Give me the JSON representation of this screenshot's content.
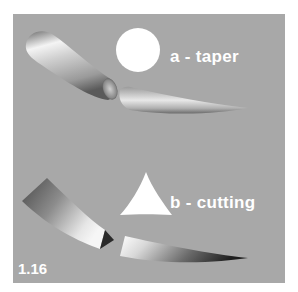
{
  "figure": {
    "number": "1.16",
    "panels": [
      {
        "id": "a",
        "label": "a - taper",
        "cross_section_shape": "circle",
        "icon": "circle-cross-section-icon"
      },
      {
        "id": "b",
        "label": "b - cutting",
        "cross_section_shape": "triangle",
        "icon": "triangle-cross-section-icon"
      }
    ]
  },
  "colors": {
    "background": "#ffffff",
    "panel": "#a8a8a8",
    "label_text": "#ffffff",
    "cross_section_fill": "#ffffff"
  }
}
